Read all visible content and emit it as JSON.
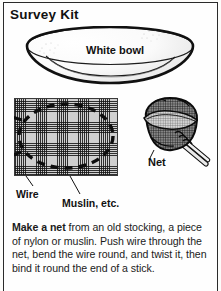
{
  "page": {
    "title": "Survey Kit",
    "border_color": "#2b2b2b",
    "background_color": "#fdfdfb"
  },
  "bowl_figure": {
    "name": "white-bowl-illustration",
    "label": "White bowl"
  },
  "mesh_figure": {
    "name": "muslin-with-wire-illustration",
    "wire_label": "Wire",
    "muslin_label": "Muslin, etc."
  },
  "net_figure": {
    "name": "finished-net-illustration",
    "label": "Net"
  },
  "instructions": {
    "lead_bold": "Make a net",
    "rest": " from an old stocking, a piece of nylon or muslin. Push wire through the net, bend the wire round, and twist it, then bind it round the end of a stick."
  }
}
